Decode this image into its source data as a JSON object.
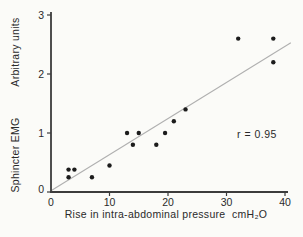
{
  "chart_data": {
    "type": "scatter",
    "title": "",
    "xlabel": "Rise in intra-abdominal pressure  cmH₂O",
    "ylabel_top": "Arbitrary units",
    "ylabel_bottom": "Sphincter EMG",
    "xlim": [
      0,
      40
    ],
    "ylim": [
      0,
      3
    ],
    "xticks": [
      0,
      10,
      20,
      30,
      40
    ],
    "yticks": [
      0,
      1,
      2,
      3
    ],
    "grid": false,
    "legend": null,
    "points": [
      [
        3,
        0.25
      ],
      [
        3,
        0.38
      ],
      [
        4,
        0.38
      ],
      [
        7,
        0.25
      ],
      [
        10,
        0.45
      ],
      [
        13,
        1.0
      ],
      [
        14,
        0.8
      ],
      [
        15,
        1.0
      ],
      [
        18,
        0.8
      ],
      [
        19.5,
        1.0
      ],
      [
        21,
        1.2
      ],
      [
        23,
        1.4
      ],
      [
        32,
        2.6
      ],
      [
        38,
        2.2
      ],
      [
        38,
        2.6
      ]
    ],
    "trendline": {
      "x1": 0,
      "y1": 0.02,
      "x2": 41,
      "y2": 2.53
    },
    "annotation": "r = 0.95",
    "annotation_pos": [
      35.2,
      0.98
    ],
    "colors": {
      "point": "#1c1c1c",
      "axis": "#3c3c3c",
      "trend": "#b0b0b0",
      "text": "#2a2a2a",
      "background": "#fbfbf8"
    }
  }
}
